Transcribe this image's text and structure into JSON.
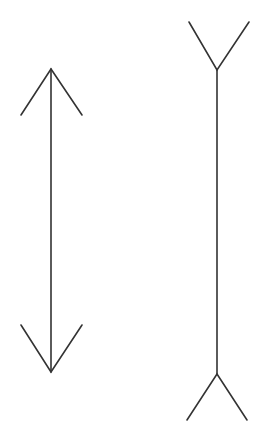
{
  "figure": {
    "name": "Müller-Lyer illusion",
    "stroke_color": "#333333",
    "background": "#ffffff",
    "left_figure": {
      "type": "arrowheads-inward",
      "shaft": {
        "x": 51,
        "y1": 69,
        "y2": 372
      }
    },
    "right_figure": {
      "type": "fins-outward",
      "shaft": {
        "x": 217,
        "y1": 70,
        "y2": 374
      }
    }
  }
}
